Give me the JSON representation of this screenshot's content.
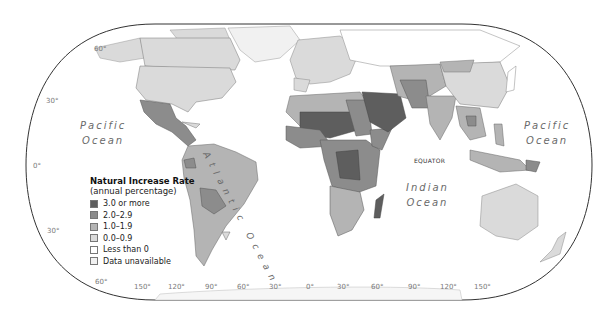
{
  "map": {
    "title": "Natural Increase Rate",
    "subtitle": "(annual percentage)",
    "legend": [
      {
        "label": "3.0 or more",
        "color": "#5e5e5e"
      },
      {
        "label": "2.0–2.9",
        "color": "#8c8c8c"
      },
      {
        "label": "1.0–1.9",
        "color": "#b4b4b4"
      },
      {
        "label": "0.0–0.9",
        "color": "#dadada"
      },
      {
        "label": "Less than 0",
        "color": "#ffffff"
      },
      {
        "label": "Data unavailable",
        "color": "#f1f1f1"
      }
    ],
    "oceans": {
      "pacific_west": [
        "Pacific",
        "Ocean"
      ],
      "pacific_east": [
        "Pacific",
        "Ocean"
      ],
      "atlantic": "Atlantic Ocean",
      "indian": [
        "Indian",
        "Ocean"
      ]
    },
    "equator_label": "EQUATOR",
    "latitude_labels": [
      "60°",
      "30°",
      "0°",
      "30°",
      "60°"
    ],
    "longitude_labels": [
      "150°",
      "120°",
      "90°",
      "60°",
      "30°",
      "0°",
      "30°",
      "60°",
      "90°",
      "120°",
      "150°"
    ]
  }
}
